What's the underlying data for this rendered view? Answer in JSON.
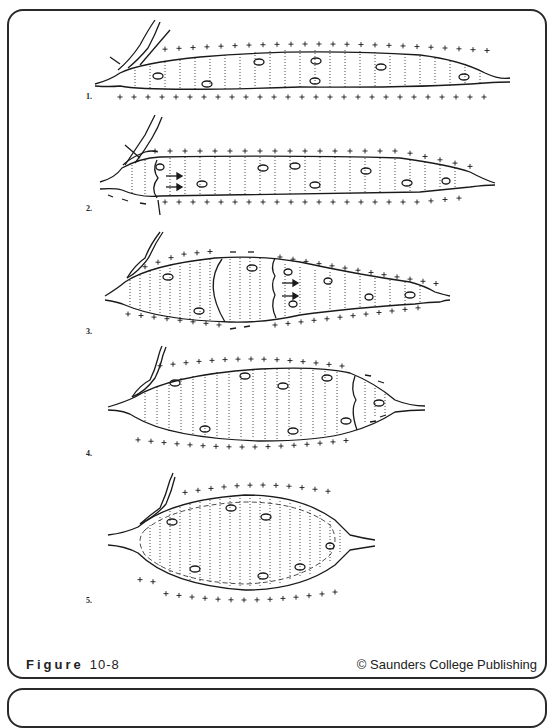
{
  "figure": {
    "caption_word": "Figure",
    "caption_number": "10-8",
    "credit": "© Saunders College Publishing",
    "line_color": "#1a1a1a",
    "stages": [
      {
        "label": "1.",
        "label_pos": [
          86,
          95
        ],
        "description": "Resting muscle fiber polarized: + outside, - inside",
        "shape": "elongated",
        "x0": 95,
        "x1": 510,
        "cy": 75,
        "half_top": 23,
        "half_bot": 8
      },
      {
        "label": "2.",
        "label_pos": [
          86,
          207
        ],
        "description": "Depolarization begins at neuromuscular junction, arrows show propagation",
        "shape": "elongated",
        "x0": 100,
        "x1": 495,
        "cy": 180,
        "half_top": 21,
        "half_bot": 13
      },
      {
        "label": "3.",
        "label_pos": [
          86,
          330
        ],
        "description": "Contracted segment bulges; depolarization wave travels along fiber",
        "shape": "fusiform",
        "x0": 105,
        "x1": 450,
        "cy": 290,
        "half_top": 30,
        "half_bot": 25
      },
      {
        "label": "4.",
        "label_pos": [
          86,
          452
        ],
        "description": "Wave nearly reaches end of fiber",
        "shape": "fusiform",
        "x0": 110,
        "x1": 425,
        "cy": 407,
        "half_top": 34,
        "half_bot": 33
      },
      {
        "label": "5.",
        "label_pos": [
          86,
          599
        ],
        "description": "Whole fiber contracted and depolarized",
        "shape": "fusiform",
        "x0": 108,
        "x1": 375,
        "cy": 543,
        "half_top": 50,
        "half_bot": 50
      }
    ]
  }
}
